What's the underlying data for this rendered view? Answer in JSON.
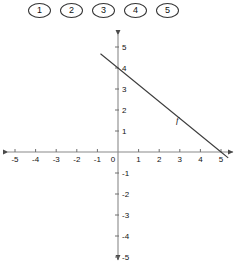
{
  "choices": {
    "name": "answer-choice-buttons",
    "items": [
      {
        "label": "1"
      },
      {
        "label": "2"
      },
      {
        "label": "3"
      },
      {
        "label": "4"
      },
      {
        "label": "5"
      }
    ]
  },
  "chart_data": {
    "type": "line",
    "title": "",
    "xlabel": "",
    "ylabel": "",
    "xlim": [
      -5.5,
      5.5
    ],
    "ylim": [
      -5.5,
      5.5
    ],
    "grid": false,
    "legend": "none",
    "axis_style": "arrows-both-ends",
    "x_ticks": [
      "-5",
      "-4",
      "-3",
      "-2",
      "-1",
      "0",
      "1",
      "2",
      "3",
      "4",
      "5"
    ],
    "x_tick_values": [
      -5,
      -4,
      -3,
      -2,
      -1,
      0,
      1,
      2,
      3,
      4,
      5
    ],
    "y_ticks": [
      "5",
      "4",
      "3",
      "2",
      "1",
      "-1",
      "-2",
      "-3",
      "-4",
      "-5"
    ],
    "y_tick_values": [
      5,
      4,
      3,
      2,
      1,
      -1,
      -2,
      -3,
      -4,
      -5
    ],
    "origin_label": "0",
    "series": [
      {
        "name": "f",
        "label": "f",
        "type": "line",
        "slope": -0.8,
        "intercept": 4,
        "x_intercept": 5,
        "y_intercept": 4,
        "points": [
          [
            -0.85,
            4.68
          ],
          [
            0,
            4
          ],
          [
            5,
            0
          ],
          [
            5.35,
            -0.28
          ]
        ],
        "color": "#3d3d3d"
      }
    ]
  }
}
